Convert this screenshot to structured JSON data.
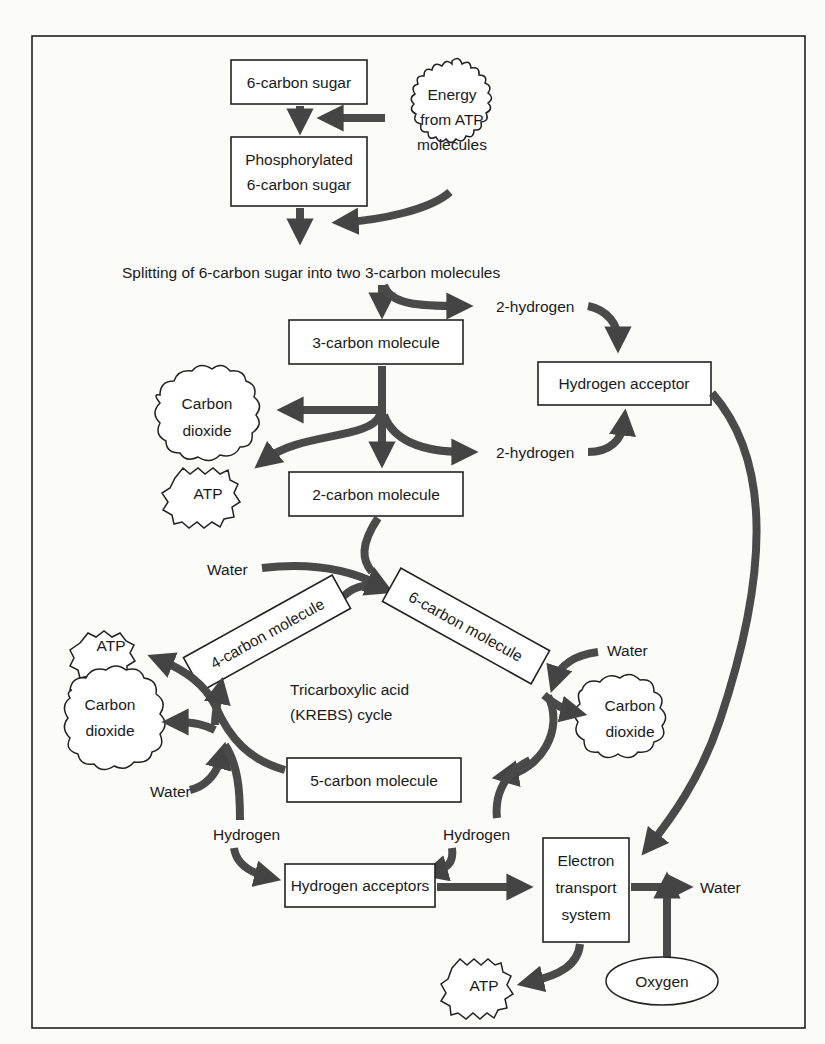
{
  "diagram": {
    "nodes": {
      "sugar6": "6-carbon sugar",
      "energy_atp": [
        "Energy",
        "from ATP",
        "molecules"
      ],
      "phos_sugar": [
        "Phosphorylated",
        "6-carbon sugar"
      ],
      "splitting": "Splitting of 6-carbon sugar into two 3-carbon molecules",
      "hydrogen2_top": "2-hydrogen",
      "carbon3": "3-carbon molecule",
      "h_acceptor": "Hydrogen acceptor",
      "co2_left_top": [
        "Carbon",
        "dioxide"
      ],
      "hydrogen2_mid": "2-hydrogen",
      "atp_top": "ATP",
      "carbon2": "2-carbon molecule",
      "water_top": "Water",
      "carbon4": "4-carbon molecule",
      "carbon6": "6-carbon molecule",
      "atp_left": "ATP",
      "water_right": "Water",
      "krebs": [
        "Tricarboxylic acid",
        "(KREBS) cycle"
      ],
      "co2_left": [
        "Carbon",
        "dioxide"
      ],
      "co2_right": [
        "Carbon",
        "dioxide"
      ],
      "carbon5": "5-carbon molecule",
      "water_left": "Water",
      "hydrogen_left": "Hydrogen",
      "hydrogen_right": "Hydrogen",
      "h_acceptors": "Hydrogen acceptors",
      "ets": [
        "Electron",
        "transport",
        "system"
      ],
      "water_out": "Water",
      "atp_bottom": "ATP",
      "oxygen": "Oxygen"
    },
    "colors": {
      "arrow": "#4a4a4a",
      "stroke": "#222222",
      "background": "#fbfbfa"
    }
  }
}
